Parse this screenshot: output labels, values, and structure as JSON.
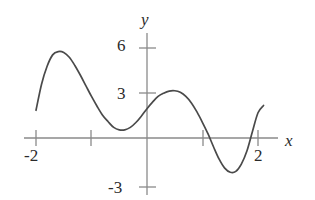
{
  "figure": {
    "title": "",
    "background_color": "#ffffff",
    "width": 315,
    "height": 200
  },
  "axes": {
    "x_axis_label": "x",
    "y_axis_label": "y",
    "axis_color": "#8a8a8a",
    "tick_color": "#8a8a8a",
    "label_color": "#2b2b2b",
    "origin_px": {
      "x": 147,
      "y": 138
    },
    "px_per_x_unit": 55.5,
    "px_per_y_unit": 16.3,
    "x_axis_span_px": {
      "start": 24,
      "end": 278
    },
    "y_axis_span_px": {
      "start": 33,
      "end": 195
    },
    "x_tick_labels": [
      "-2",
      "2"
    ],
    "y_tick_labels": [
      "6",
      "3",
      "-3"
    ],
    "x_ticks_values": [
      -2,
      -1,
      0,
      1,
      2
    ],
    "y_ticks_values": [
      6,
      3,
      -3
    ]
  },
  "chart_data": {
    "type": "line",
    "title": "",
    "xlabel": "x",
    "ylabel": "y",
    "xlim": [
      -2.2,
      2.35
    ],
    "ylim": [
      -3.6,
      6.6
    ],
    "grid": false,
    "legend": null,
    "labeled_x_ticks": [
      -2,
      2
    ],
    "labeled_y_ticks": [
      6,
      3,
      -3
    ],
    "unlabeled_x_ticks": [
      -1,
      0,
      1
    ],
    "line_color": "#4a4a4a",
    "line_width": 1.7,
    "series": [
      {
        "name": "curve",
        "x": [
          -2.0,
          -1.9,
          -1.8,
          -1.7,
          -1.6,
          -1.5,
          -1.4,
          -1.3,
          -1.2,
          -1.1,
          -1.0,
          -0.9,
          -0.8,
          -0.7,
          -0.6,
          -0.5,
          -0.4,
          -0.3,
          -0.2,
          -0.1,
          0.0,
          0.1,
          0.2,
          0.3,
          0.4,
          0.5,
          0.6,
          0.7,
          0.8,
          0.9,
          1.0,
          1.1,
          1.2,
          1.3,
          1.4,
          1.5,
          1.6,
          1.7,
          1.8,
          1.9,
          2.0,
          2.1
        ],
        "y": [
          1.7,
          3.3,
          4.4,
          5.1,
          5.3,
          5.25,
          4.95,
          4.45,
          3.85,
          3.2,
          2.55,
          1.95,
          1.4,
          1.0,
          0.65,
          0.5,
          0.5,
          0.65,
          0.95,
          1.35,
          1.8,
          2.2,
          2.55,
          2.75,
          2.88,
          2.9,
          2.8,
          2.55,
          2.15,
          1.6,
          0.95,
          0.25,
          -0.55,
          -1.3,
          -1.85,
          -2.1,
          -2.05,
          -1.6,
          -0.8,
          0.4,
          1.55,
          2.0
        ],
        "critical_points": [
          {
            "kind": "local-max",
            "x": -1.6,
            "y": 5.3
          },
          {
            "kind": "local-min",
            "x": -0.45,
            "y": 0.5
          },
          {
            "kind": "local-max",
            "x": 0.52,
            "y": 2.9
          },
          {
            "kind": "local-min",
            "x": 1.52,
            "y": -2.1
          }
        ],
        "x_intercepts": [
          1.21,
          1.84
        ],
        "y_intercept": 1.8,
        "endpoints": [
          {
            "x": -2.0,
            "y": 1.7
          },
          {
            "x": 2.1,
            "y": 2.0
          }
        ]
      }
    ]
  }
}
